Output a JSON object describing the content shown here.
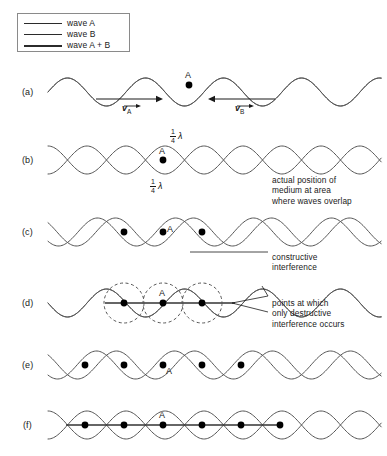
{
  "figure": {
    "width": 387,
    "height": 456,
    "background": "#ffffff",
    "stroke_color": "#555555",
    "resultant_color": "#333333",
    "dot_color": "#000000",
    "text_color": "#1a1a1a"
  },
  "legend": {
    "border_color": "#8a8a8a",
    "items": [
      {
        "label": "wave A",
        "swatch": "thin-line-swatch",
        "width": 1
      },
      {
        "label": "wave B",
        "swatch": "thin-line-swatch",
        "width": 1
      },
      {
        "label": "wave A + B",
        "swatch": "thick-line-swatch",
        "width": 2
      }
    ]
  },
  "rows": [
    {
      "id": "a",
      "label": "(a)",
      "baseline_y": 92,
      "point_label": "A",
      "description": "two waves in phase moving toward each other",
      "waves": [
        {
          "name": "wave A",
          "amplitude": 14,
          "wavelength": 78,
          "phase_shift": 0,
          "width": 1
        },
        {
          "name": "wave B",
          "amplitude": 14,
          "wavelength": 78,
          "phase_shift": 0,
          "width": 1
        }
      ],
      "dots": [
        {
          "x": 189,
          "y": 85,
          "label": "A"
        }
      ],
      "arrows": [
        {
          "name": "v-A-arrow",
          "direction": "right",
          "x1": 96,
          "x2": 163,
          "y": 99,
          "label": "v",
          "subscript": "A"
        },
        {
          "name": "v-B-arrow",
          "direction": "left",
          "x1": 275,
          "x2": 208,
          "y": 99,
          "label": "v",
          "subscript": "B"
        }
      ]
    },
    {
      "id": "b",
      "label": "(b)",
      "baseline_y": 160,
      "point_label": "A",
      "description": "waves displaced one quarter wavelength in opposite directions",
      "waves": [
        {
          "name": "wave A",
          "amplitude": 14,
          "wavelength": 78,
          "phase_shift": 19.5,
          "width": 1
        },
        {
          "name": "wave B",
          "amplitude": 14,
          "wavelength": 78,
          "phase_shift": -19.5,
          "width": 1
        }
      ],
      "dots": [
        {
          "x": 163,
          "y": 160,
          "label": "A"
        }
      ],
      "measurements": [
        {
          "name": "quarter-lambda-top",
          "numerator": "1",
          "denominator": "4",
          "symbol": "λ",
          "direction": "left"
        },
        {
          "name": "quarter-lambda-bottom",
          "numerator": "1",
          "denominator": "4",
          "symbol": "λ",
          "direction": "right"
        }
      ],
      "callout": {
        "text": "actual position of\nmedium at area\nwhere waves overlap",
        "x": 272,
        "y": 175
      }
    },
    {
      "id": "c",
      "label": "(c)",
      "baseline_y": 232,
      "point_label": "A",
      "description": "waves displaced half a wavelength apart producing constructive interference",
      "waves": [
        {
          "name": "wave A",
          "amplitude": 14,
          "wavelength": 78,
          "phase_shift": 30,
          "width": 1
        },
        {
          "name": "wave B",
          "amplitude": 14,
          "wavelength": 78,
          "phase_shift": -30,
          "width": 1
        }
      ],
      "dots": [
        {
          "x": 124,
          "y": 232,
          "label": ""
        },
        {
          "x": 163,
          "y": 232,
          "label": "A"
        },
        {
          "x": 202,
          "y": 232,
          "label": ""
        }
      ],
      "callout": {
        "text": "constructive\ninterference",
        "x": 272,
        "y": 252
      }
    },
    {
      "id": "d",
      "label": "(d)",
      "baseline_y": 303,
      "point_label": "A",
      "description": "waves exactly out of phase, resultant is a straight line, destructive interference at nodes",
      "waves": [
        {
          "name": "wave A",
          "amplitude": 14,
          "wavelength": 78,
          "phase_shift": 39,
          "width": 1
        },
        {
          "name": "wave B",
          "amplitude": 14,
          "wavelength": 78,
          "phase_shift": -39,
          "width": 1
        }
      ],
      "resultant": {
        "name": "flat-resultant-line",
        "type": "straight-line",
        "x1": 105,
        "x2": 235
      },
      "dots": [
        {
          "x": 124,
          "y": 303,
          "label": ""
        },
        {
          "x": 163,
          "y": 303,
          "label": "A"
        },
        {
          "x": 202,
          "y": 303,
          "label": ""
        }
      ],
      "node_circles": [
        {
          "cx": 124,
          "cy": 303,
          "r": 20
        },
        {
          "cx": 163,
          "cy": 303,
          "r": 20
        },
        {
          "cx": 202,
          "cy": 303,
          "r": 20
        }
      ],
      "callout": {
        "text": "points at which\nonly destructive\ninterference occurs",
        "x": 272,
        "y": 298
      }
    },
    {
      "id": "e",
      "label": "(e)",
      "baseline_y": 365,
      "point_label": "A",
      "description": "waves displaced again, crossing at fixed node points",
      "waves": [
        {
          "name": "wave A",
          "amplitude": 14,
          "wavelength": 78,
          "phase_shift": 49,
          "width": 1
        },
        {
          "name": "wave B",
          "amplitude": 14,
          "wavelength": 78,
          "phase_shift": -49,
          "width": 1
        }
      ],
      "dots": [
        {
          "x": 85,
          "y": 365,
          "label": ""
        },
        {
          "x": 124,
          "y": 365,
          "label": ""
        },
        {
          "x": 163,
          "y": 365,
          "label": "A"
        },
        {
          "x": 202,
          "y": 365,
          "label": ""
        },
        {
          "x": 241,
          "y": 365,
          "label": ""
        }
      ]
    },
    {
      "id": "f",
      "label": "(f)",
      "baseline_y": 425,
      "point_label": "A",
      "description": "standing wave envelope with nodes, resultant is a straight line",
      "waves": [
        {
          "name": "wave A",
          "amplitude": 14,
          "wavelength": 78,
          "phase_shift": 19.5,
          "width": 1
        },
        {
          "name": "wave B",
          "amplitude": 14,
          "wavelength": 78,
          "phase_shift": -19.5,
          "width": 1
        }
      ],
      "resultant": {
        "name": "flat-resultant-line",
        "type": "straight-line",
        "x1": 66,
        "x2": 280
      },
      "dots": [
        {
          "x": 85,
          "y": 425,
          "label": ""
        },
        {
          "x": 124,
          "y": 425,
          "label": ""
        },
        {
          "x": 163,
          "y": 425,
          "label": "A"
        },
        {
          "x": 202,
          "y": 425,
          "label": ""
        },
        {
          "x": 241,
          "y": 425,
          "label": ""
        },
        {
          "x": 280,
          "y": 425,
          "label": ""
        }
      ]
    }
  ],
  "wave_extent": {
    "x_start": 48,
    "x_end": 382
  }
}
